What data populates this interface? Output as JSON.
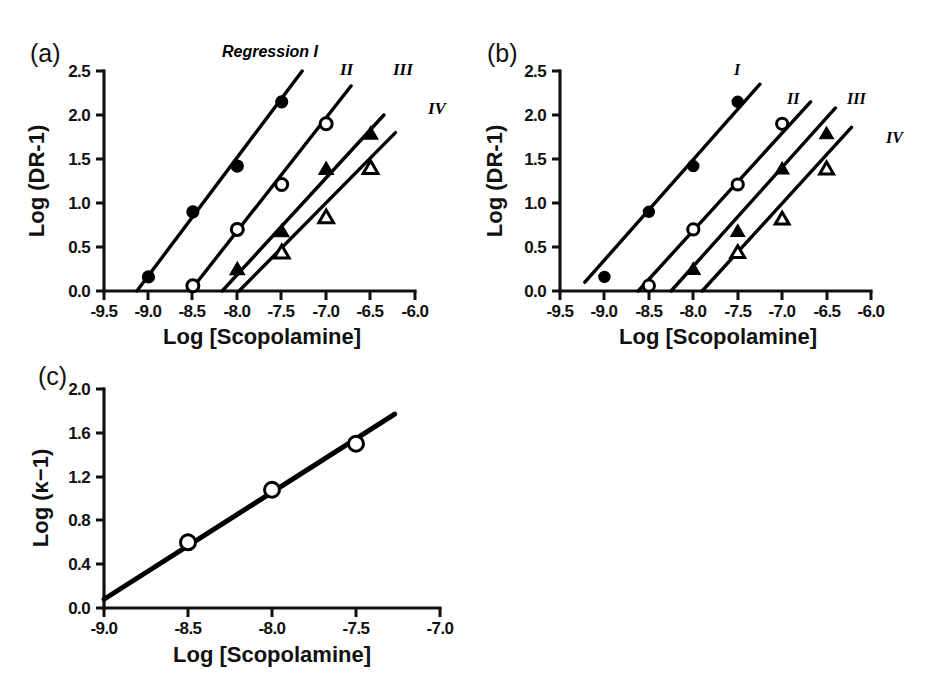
{
  "figure": {
    "panels": [
      "a",
      "b",
      "c"
    ]
  },
  "panel_a": {
    "letter": "(a)",
    "xlabel": "Log [Scopolamine]",
    "ylabel": "Log (DR-1)",
    "annotation": "Regression I",
    "series_labels": [
      "II",
      "III",
      "IV"
    ],
    "xticks": [
      "-9.5",
      "-9.0",
      "-8.5",
      "-8.0",
      "-7.5",
      "-7.0",
      "-6.5",
      "-6.0"
    ],
    "yticks": [
      "0.0",
      "0.5",
      "1.0",
      "1.5",
      "2.0",
      "2.5"
    ]
  },
  "panel_b": {
    "letter": "(b)",
    "xlabel": "Log [Scopolamine]",
    "ylabel": "Log (DR-1)",
    "series_labels": [
      "I",
      "II",
      "III",
      "IV"
    ],
    "xticks": [
      "-9.5",
      "-9.0",
      "-8.5",
      "-8.0",
      "-7.5",
      "-7.0",
      "-6.5",
      "-6.0"
    ],
    "yticks": [
      "0.0",
      "0.5",
      "1.0",
      "1.5",
      "2.0",
      "2.5"
    ]
  },
  "panel_c": {
    "letter": "(c)",
    "xlabel": "Log [Scopolamine]",
    "ylabel": "Log (κ−1)",
    "xticks": [
      "-9.0",
      "-8.5",
      "-8.0",
      "-7.5",
      "-7.0"
    ],
    "yticks": [
      "0.0",
      "0.4",
      "0.8",
      "1.2",
      "1.6",
      "2.0"
    ]
  },
  "chart_data": [
    {
      "type": "scatter",
      "panel": "a",
      "title": "(a)",
      "annotation": "Regression I",
      "xlabel": "Log [Scopolamine]",
      "ylabel": "Log (DR-1)",
      "xlim": [
        -9.5,
        -6.0
      ],
      "ylim": [
        0.0,
        2.5
      ],
      "xticks": [
        -9.5,
        -9.0,
        -8.5,
        -8.0,
        -7.5,
        -7.0,
        -6.5,
        -6.0
      ],
      "yticks": [
        0.0,
        0.5,
        1.0,
        1.5,
        2.0,
        2.5
      ],
      "grid": false,
      "legend": "inline-line-labels",
      "series": [
        {
          "name": "I",
          "marker": "filled-circle",
          "x": [
            -9.0,
            -8.5,
            -8.0,
            -7.5
          ],
          "y": [
            0.16,
            0.9,
            1.42,
            2.15
          ],
          "fit_line": {
            "x": [
              -9.13,
              -7.27
            ],
            "y": [
              0.0,
              2.5
            ]
          }
        },
        {
          "name": "II",
          "marker": "open-circle",
          "x": [
            -8.5,
            -8.0,
            -7.5,
            -7.0
          ],
          "y": [
            0.06,
            0.7,
            1.21,
            1.9
          ],
          "fit_line": {
            "x": [
              -8.53,
              -6.72
            ],
            "y": [
              0.0,
              2.33
            ]
          }
        },
        {
          "name": "III",
          "marker": "filled-triangle",
          "x": [
            -8.0,
            -7.5,
            -7.0,
            -6.5
          ],
          "y": [
            0.25,
            0.68,
            1.39,
            1.79
          ],
          "fit_line": {
            "x": [
              -8.17,
              -6.35
            ],
            "y": [
              0.0,
              2.0
            ]
          }
        },
        {
          "name": "IV",
          "marker": "open-triangle",
          "x": [
            -7.5,
            -7.0,
            -6.5
          ],
          "y": [
            0.44,
            0.84,
            1.4
          ],
          "fit_line": {
            "x": [
              -7.98,
              -6.22
            ],
            "y": [
              0.0,
              1.8
            ]
          }
        }
      ]
    },
    {
      "type": "scatter",
      "panel": "b",
      "title": "(b)",
      "xlabel": "Log [Scopolamine]",
      "ylabel": "Log (DR-1)",
      "xlim": [
        -9.5,
        -6.0
      ],
      "ylim": [
        0.0,
        2.5
      ],
      "xticks": [
        -9.5,
        -9.0,
        -8.5,
        -8.0,
        -7.5,
        -7.0,
        -6.5,
        -6.0
      ],
      "yticks": [
        0.0,
        0.5,
        1.0,
        1.5,
        2.0,
        2.5
      ],
      "grid": false,
      "legend": "inline-line-labels",
      "series": [
        {
          "name": "I",
          "marker": "filled-circle",
          "x": [
            -9.0,
            -8.5,
            -8.0,
            -7.5
          ],
          "y": [
            0.16,
            0.9,
            1.42,
            2.15
          ],
          "fit_line": {
            "x": [
              -9.22,
              -7.25
            ],
            "y": [
              0.1,
              2.35
            ]
          }
        },
        {
          "name": "II",
          "marker": "open-circle",
          "x": [
            -8.5,
            -8.0,
            -7.5,
            -7.0
          ],
          "y": [
            0.06,
            0.7,
            1.21,
            1.9
          ],
          "fit_line": {
            "x": [
              -8.62,
              -6.68
            ],
            "y": [
              0.0,
              2.15
            ]
          }
        },
        {
          "name": "III",
          "marker": "filled-triangle",
          "x": [
            -8.0,
            -7.5,
            -7.0,
            -6.5
          ],
          "y": [
            0.25,
            0.68,
            1.39,
            1.79
          ],
          "fit_line": {
            "x": [
              -8.25,
              -6.4
            ],
            "y": [
              0.0,
              2.08
            ]
          }
        },
        {
          "name": "IV",
          "marker": "open-triangle",
          "x": [
            -7.5,
            -7.0,
            -6.5
          ],
          "y": [
            0.44,
            0.82,
            1.39
          ],
          "fit_line": {
            "x": [
              -7.9,
              -6.22
            ],
            "y": [
              0.0,
              1.86
            ]
          }
        }
      ]
    },
    {
      "type": "scatter",
      "panel": "c",
      "title": "(c)",
      "xlabel": "Log [Scopolamine]",
      "ylabel": "Log (κ−1)",
      "xlim": [
        -9.0,
        -7.0
      ],
      "ylim": [
        0.0,
        2.0
      ],
      "xticks": [
        -9.0,
        -8.5,
        -8.0,
        -7.5,
        -7.0
      ],
      "yticks": [
        0.0,
        0.4,
        0.8,
        1.2,
        1.6,
        2.0
      ],
      "grid": false,
      "legend": "none",
      "series": [
        {
          "name": "kappa",
          "marker": "open-circle",
          "x": [
            -8.5,
            -8.0,
            -7.5
          ],
          "y": [
            0.6,
            1.08,
            1.5
          ],
          "fit_line": {
            "x": [
              -9.0,
              -7.27
            ],
            "y": [
              0.08,
              1.77
            ]
          }
        }
      ]
    }
  ]
}
